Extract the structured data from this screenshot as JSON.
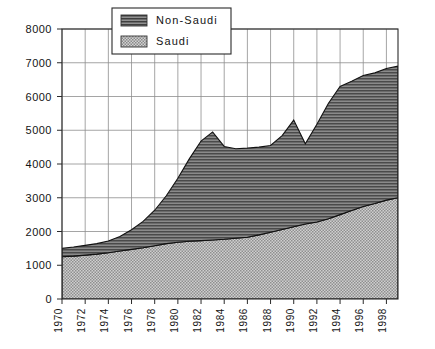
{
  "chart_data": {
    "type": "area",
    "stacked": true,
    "title": "",
    "subtitle": "",
    "xlabel": "",
    "ylabel": "",
    "xlim": [
      1970,
      1999
    ],
    "ylim": [
      0,
      8000
    ],
    "y_ticks": [
      0,
      1000,
      2000,
      3000,
      4000,
      5000,
      6000,
      7000,
      8000
    ],
    "y_tick_labels": [
      "0",
      "1000",
      "2000",
      "3000",
      "4000",
      "5000",
      "6000",
      "7000",
      "8000"
    ],
    "x_ticks": [
      1970,
      1972,
      1974,
      1976,
      1978,
      1980,
      1982,
      1984,
      1986,
      1988,
      1990,
      1992,
      1994,
      1996,
      1998
    ],
    "x_tick_labels": [
      "1970",
      "1972",
      "1974",
      "1976",
      "1978",
      "1980",
      "1982",
      "1984",
      "1986",
      "1988",
      "1990",
      "1992",
      "1994",
      "1996",
      "1998"
    ],
    "x_tick_rotation": -90,
    "grid": true,
    "grid_x": true,
    "grid_y": true,
    "legend_position": "top-left-inside",
    "x": [
      1970,
      1971,
      1972,
      1973,
      1974,
      1975,
      1976,
      1977,
      1978,
      1979,
      1980,
      1981,
      1982,
      1983,
      1984,
      1985,
      1986,
      1987,
      1988,
      1989,
      1990,
      1991,
      1992,
      1993,
      1994,
      1995,
      1996,
      1997,
      1998,
      1999
    ],
    "series": [
      {
        "name": "Saudi",
        "fill_pattern": "checker",
        "fill_color": "#b0b0b0",
        "values": [
          1250,
          1270,
          1300,
          1330,
          1370,
          1420,
          1470,
          1520,
          1580,
          1640,
          1680,
          1710,
          1730,
          1750,
          1770,
          1800,
          1830,
          1900,
          1980,
          2060,
          2140,
          2220,
          2280,
          2380,
          2500,
          2620,
          2740,
          2830,
          2930,
          3000
        ]
      },
      {
        "name": "Non-Saudi",
        "fill_pattern": "horizontal-lines",
        "fill_color": "#6e6e6e",
        "values": [
          250,
          270,
          290,
          310,
          350,
          430,
          580,
          780,
          1050,
          1420,
          1900,
          2450,
          2950,
          3200,
          2750,
          2650,
          2640,
          2600,
          2570,
          2780,
          3160,
          2380,
          2900,
          3420,
          3800,
          3830,
          3880,
          3870,
          3900,
          3900
        ]
      }
    ],
    "totals": [
      1500,
      1540,
      1590,
      1640,
      1720,
      1850,
      2050,
      2300,
      2630,
      3060,
      3580,
      4160,
      4680,
      4950,
      4520,
      4450,
      4470,
      4500,
      4550,
      4840,
      5300,
      4600,
      5180,
      5800,
      6300,
      6450,
      6620,
      6700,
      6830,
      6900
    ]
  },
  "legend": {
    "entries": [
      {
        "label": "Non-Saudi",
        "swatch": "dark-horizontal-lines"
      },
      {
        "label": "Saudi",
        "swatch": "light-checker"
      }
    ]
  }
}
